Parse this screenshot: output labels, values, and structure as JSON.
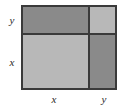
{
  "figure": {
    "square": {
      "border_color": "#3a3a3a",
      "base_fill": "#b8b8b8"
    },
    "cells": [
      {
        "id": "top-left",
        "product": "xy",
        "shade": "dark",
        "color": "#8a8a8a"
      },
      {
        "id": "top-right",
        "product": "y2",
        "shade": "light",
        "color": "#b8b8b8"
      },
      {
        "id": "bottom-left",
        "product": "x2",
        "shade": "light",
        "color": "#b8b8b8"
      },
      {
        "id": "bottom-right",
        "product": "xy",
        "shade": "dark",
        "color": "#8a8a8a"
      }
    ],
    "labels": {
      "left_top": "y",
      "left_bottom": "x",
      "bottom_left": "x",
      "bottom_right": "y"
    }
  }
}
